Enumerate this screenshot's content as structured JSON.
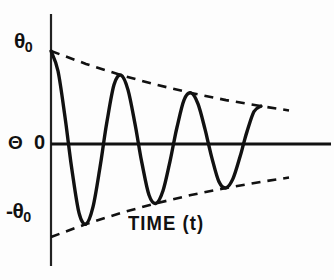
{
  "figure": {
    "name": "damped-oscillation-plot",
    "background_color": "#fdfdfd",
    "ink_color": "#111111"
  },
  "labels": {
    "y_axis_title": "Θ",
    "y_tick_top_symbol": "θ",
    "y_tick_top_subscript": "0",
    "y_tick_zero": "0",
    "y_tick_bottom_symbol": "-θ",
    "y_tick_bottom_subscript": "0",
    "x_axis_title_main": "TIME (",
    "x_axis_title_var": "t",
    "x_axis_title_close": ")"
  },
  "chart_data": {
    "type": "line",
    "title": "",
    "xlabel": "TIME (t)",
    "ylabel": "Θ",
    "grid": false,
    "legend": "none",
    "xlim": [
      0,
      4.0
    ],
    "ylim": [
      -1.15,
      1.15
    ],
    "x_tick_labels": [],
    "y_tick_labels": [
      "θ₀",
      "0",
      "-θ₀"
    ],
    "y_tick_values": [
      1,
      0,
      -1
    ],
    "series": [
      {
        "name": "damped oscillation",
        "style": "solid",
        "line_width": 3,
        "color": "#111111",
        "function": "theta0 * exp(-0.30*t) * cos(2*pi*t)",
        "amplitude": 1.0,
        "decay_constant": 0.3,
        "period": 1.0,
        "points": [
          {
            "t": 0.0,
            "theta": 1.0
          },
          {
            "t": 0.1,
            "theta": 0.785
          },
          {
            "t": 0.2,
            "theta": 0.291
          },
          {
            "t": 0.25,
            "theta": 0.0
          },
          {
            "t": 0.3,
            "theta": -0.282
          },
          {
            "t": 0.4,
            "theta": -0.74
          },
          {
            "t": 0.5,
            "theta": -0.861
          },
          {
            "t": 0.6,
            "theta": -0.677
          },
          {
            "t": 0.7,
            "theta": -0.251
          },
          {
            "t": 0.75,
            "theta": 0.0
          },
          {
            "t": 0.8,
            "theta": 0.243
          },
          {
            "t": 0.9,
            "theta": 0.637
          },
          {
            "t": 1.0,
            "theta": 0.741
          },
          {
            "t": 1.1,
            "theta": 0.582
          },
          {
            "t": 1.2,
            "theta": 0.216
          },
          {
            "t": 1.25,
            "theta": 0.0
          },
          {
            "t": 1.3,
            "theta": -0.209
          },
          {
            "t": 1.4,
            "theta": -0.549
          },
          {
            "t": 1.5,
            "theta": -0.638
          },
          {
            "t": 1.6,
            "theta": -0.502
          },
          {
            "t": 1.7,
            "theta": -0.186
          },
          {
            "t": 1.75,
            "theta": 0.0
          },
          {
            "t": 1.8,
            "theta": 0.18
          },
          {
            "t": 1.9,
            "theta": 0.472
          },
          {
            "t": 2.0,
            "theta": 0.549
          },
          {
            "t": 2.1,
            "theta": 0.431
          },
          {
            "t": 2.2,
            "theta": 0.16
          },
          {
            "t": 2.25,
            "theta": 0.0
          },
          {
            "t": 2.3,
            "theta": -0.155
          },
          {
            "t": 2.4,
            "theta": -0.407
          },
          {
            "t": 2.5,
            "theta": -0.472
          },
          {
            "t": 2.6,
            "theta": -0.372
          },
          {
            "t": 2.7,
            "theta": -0.138
          },
          {
            "t": 2.75,
            "theta": 0.0
          },
          {
            "t": 2.8,
            "theta": 0.133
          },
          {
            "t": 2.9,
            "theta": 0.35
          },
          {
            "t": 3.0,
            "theta": 0.407
          }
        ],
        "peaks": [
          {
            "t": 0.0,
            "theta": 1.0
          },
          {
            "t": 1.0,
            "theta": 0.741
          },
          {
            "t": 2.0,
            "theta": 0.549
          },
          {
            "t": 3.0,
            "theta": 0.407
          }
        ],
        "troughs": [
          {
            "t": 0.5,
            "theta": -0.861
          },
          {
            "t": 1.5,
            "theta": -0.638
          },
          {
            "t": 2.5,
            "theta": -0.472
          }
        ],
        "zero_crossings": [
          0.25,
          0.75,
          1.25,
          1.75,
          2.25,
          2.75
        ]
      },
      {
        "name": "upper envelope",
        "style": "dashed",
        "line_width": 2.4,
        "color": "#111111",
        "function": "+theta0 * exp(-0.30*t)",
        "points": [
          {
            "t": 0.0,
            "theta": 1.0
          },
          {
            "t": 0.5,
            "theta": 0.861
          },
          {
            "t": 1.0,
            "theta": 0.741
          },
          {
            "t": 1.5,
            "theta": 0.638
          },
          {
            "t": 2.0,
            "theta": 0.549
          },
          {
            "t": 2.5,
            "theta": 0.472
          },
          {
            "t": 3.0,
            "theta": 0.407
          },
          {
            "t": 3.4,
            "theta": 0.361
          }
        ]
      },
      {
        "name": "lower envelope",
        "style": "dashed",
        "line_width": 2.4,
        "color": "#111111",
        "function": "-theta0 * exp(-0.30*t)",
        "points": [
          {
            "t": 0.0,
            "theta": -1.0
          },
          {
            "t": 0.5,
            "theta": -0.861
          },
          {
            "t": 1.0,
            "theta": -0.741
          },
          {
            "t": 1.5,
            "theta": -0.638
          },
          {
            "t": 2.0,
            "theta": -0.549
          },
          {
            "t": 2.5,
            "theta": -0.472
          },
          {
            "t": 3.0,
            "theta": -0.407
          },
          {
            "t": 3.4,
            "theta": -0.361
          }
        ]
      }
    ]
  }
}
